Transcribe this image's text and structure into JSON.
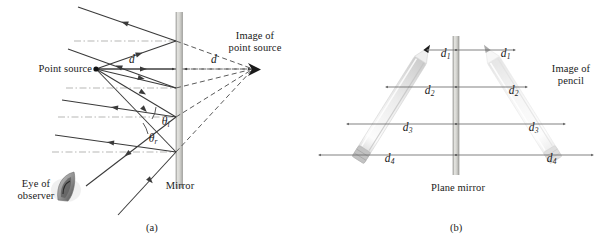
{
  "figure": {
    "panels": [
      {
        "id": "a",
        "sublabel": "(a)",
        "labels": {
          "point_source": "Point source",
          "image_of_point_source": "Image of\npoint source",
          "eye_of_observer": "Eye of\nobserver",
          "mirror": "Mirror",
          "distance_object": "d",
          "distance_image": "d",
          "angle_incidence": "θ",
          "angle_incidence_sub": "i",
          "angle_reflection": "θ",
          "angle_reflection_sub": "r"
        }
      },
      {
        "id": "b",
        "sublabel": "(b)",
        "labels": {
          "image_of_pencil": "Image of\npencil",
          "plane_mirror": "Plane mirror"
        },
        "distances": [
          {
            "symbol": "d",
            "sub": "1",
            "left_label": "d",
            "right_label": "d"
          },
          {
            "symbol": "d",
            "sub": "2",
            "left_label": "d",
            "right_label": "d"
          },
          {
            "symbol": "d",
            "sub": "3",
            "left_label": "d",
            "right_label": "d"
          },
          {
            "symbol": "d",
            "sub": "4",
            "left_label": "d",
            "right_label": "d"
          }
        ]
      }
    ],
    "colors": {
      "ink": "#1a1a1a",
      "ray_solid": "#3a3a3a",
      "ray_dashed": "#5a5a5a",
      "normal_line": "#8a8a8a",
      "mirror_fill": "#d8d8d4",
      "mirror_edge": "#9a9a96",
      "pencil_body": "#efefef",
      "pencil_image": "#f6f6f6",
      "measure_line": "#6a6a6a",
      "background": "#ffffff"
    }
  }
}
